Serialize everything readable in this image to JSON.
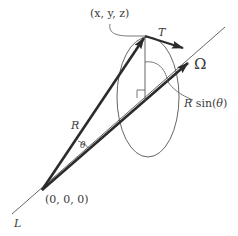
{
  "diagram": {
    "colors": {
      "stroke": "#2b2b2b",
      "thin_stroke": "#555555",
      "text": "#3a3a3a",
      "background": "#ffffff"
    },
    "labels": {
      "point": "(x, y, z)",
      "tangent": "T",
      "axis": "Ω",
      "radius_perp": "R sin(θ)",
      "radius_perp_R": "R",
      "radius_perp_sin": " sin(",
      "radius_perp_theta": "θ",
      "radius_perp_close": ")",
      "radius": "R",
      "angle": "θ",
      "origin": "(0, 0, 0)",
      "line": "L"
    },
    "geometry": {
      "origin": [
        42,
        190
      ],
      "point_T": [
        145,
        36
      ],
      "omega_arrow_tip": [
        188,
        63
      ],
      "axis_far_end": [
        225,
        27
      ],
      "axis_near_end": [
        12,
        214
      ],
      "foot_of_perpendicular": [
        145,
        101
      ],
      "tangent_arrow_tip": [
        183,
        48
      ],
      "circle_center": [
        148,
        97
      ],
      "circle_rx": 31,
      "circle_ry": 60
    }
  }
}
